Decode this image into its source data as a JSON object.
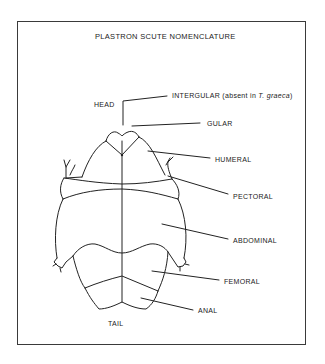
{
  "diagram": {
    "title": "PLASTRON SCUTE NOMENCLATURE",
    "orientation_labels": {
      "head": "HEAD",
      "tail": "TAIL"
    },
    "scute_labels": [
      {
        "id": "intergular",
        "label": "INTERGULAR (absent in ",
        "label_italic": "T. graeca",
        "label_suffix": ")"
      },
      {
        "id": "gular",
        "label": "GULAR"
      },
      {
        "id": "humeral",
        "label": "HUMERAL"
      },
      {
        "id": "pectoral",
        "label": "PECTORAL"
      },
      {
        "id": "abdominal",
        "label": "ABDOMINAL"
      },
      {
        "id": "femoral",
        "label": "FEMORAL"
      },
      {
        "id": "anal",
        "label": "ANAL"
      }
    ],
    "colors": {
      "line": "#222222",
      "background": "#ffffff"
    }
  }
}
